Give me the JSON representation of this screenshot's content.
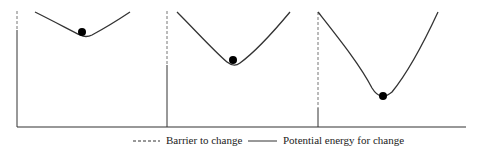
{
  "colors": {
    "line": "#333333",
    "ball": "#000000",
    "dashed": "#777777"
  },
  "baseline": {
    "x1": 17,
    "x2": 466,
    "y": 127
  },
  "panels": [
    {
      "id": "low-barrier",
      "barrier_x": 17,
      "dash_top": 11,
      "dash_bottom": 30,
      "curve": "M35,12 C55,22 70,30 80,35 C84,37 88,37 92,35 C105,28 118,20 130,12",
      "ball": {
        "cx": 82,
        "cy": 32,
        "r": 4
      }
    },
    {
      "id": "medium-barrier",
      "barrier_x": 167,
      "dash_top": 11,
      "dash_bottom": 65,
      "curve": "M177,12 C195,30 215,52 227,62 C232,66 236,66 240,63 C255,52 275,30 290,12",
      "ball": {
        "cx": 233,
        "cy": 60,
        "r": 4
      }
    },
    {
      "id": "high-barrier",
      "barrier_x": 318,
      "dash_top": 12,
      "dash_bottom": 108,
      "curve": "M318,12 C340,40 360,65 372,88 C378,98 385,98 392,92 C410,70 425,40 438,12",
      "ball": {
        "cx": 383,
        "cy": 96,
        "r": 4
      }
    }
  ],
  "legend": {
    "barrier": {
      "label": "Barrier to change",
      "sample_x1": 133,
      "sample_x2": 160,
      "y": 141
    },
    "energy": {
      "label": "Potential energy for change",
      "sample_x1": 248,
      "sample_x2": 277,
      "y": 141
    }
  }
}
